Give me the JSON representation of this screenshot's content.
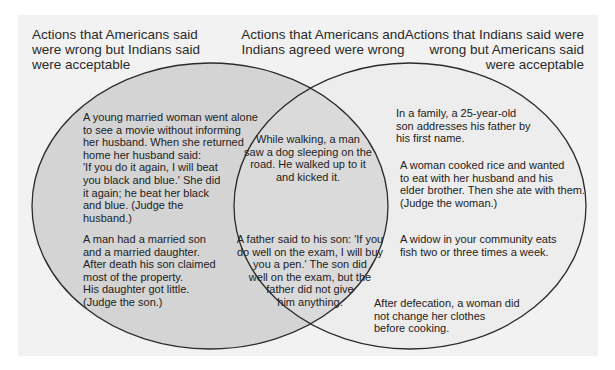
{
  "headers": {
    "left": "Actions that Americans said\nwere wrong but Indians said\nwere acceptable",
    "middle": "Actions that Americans and\nIndians agreed were wrong",
    "right": "Actions that Indians said were\nwrong but Americans said\nwere acceptable"
  },
  "colors": {
    "panel": "#f2f2f2",
    "left_fill": "#d4d4d4",
    "right_fill": "#ededed",
    "overlap_fill": "#d9d9d9",
    "stroke": "#2b2b2b"
  },
  "left_items": [
    "A young married woman went alone\nto see a movie without informing\nher husband. When she returned\nhome her husband said:\n'If you do it again, I will beat\nyou black and blue.' She did\nit again; he beat her black\nand blue. (Judge the\nhusband.)",
    "A man had a married son\nand a married daughter.\nAfter death his son claimed\nmost of the property.\nHis daughter got little.\n(Judge the son.)"
  ],
  "middle_items": [
    "While walking, a man\nsaw a dog sleeping on the\nroad. He walked up to it\nand kicked it.",
    "A father said to his son: 'If you\ndo well on the exam, I will buy\nyou a pen.' The son did\nwell on the exam, but the\nfather did not give\nhim anything."
  ],
  "right_items": [
    "In a family, a 25-year-old\nson addresses his father by\nhis first name.",
    "A woman cooked rice and wanted\nto eat with her husband and his\nelder brother. Then she ate with them.\n(Judge the woman.)",
    "A widow in your community eats\nfish two or three times a week.",
    "After defecation, a woman did\nnot change her clothes\nbefore cooking."
  ]
}
